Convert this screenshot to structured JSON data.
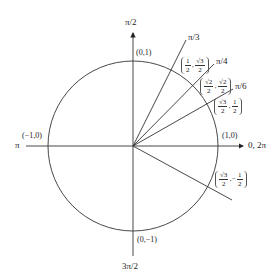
{
  "diagram": {
    "center": {
      "x": 133,
      "y": 146
    },
    "radius": 85,
    "colors": {
      "stroke": "#333333",
      "text": "#222222"
    },
    "axes": {
      "positive_x_label": "0, 2π",
      "negative_x_label": "π",
      "positive_y_label": "π/2",
      "negative_y_label": "3π/2"
    },
    "axis_points": {
      "right": "(1,0)",
      "left": "(−1,0)",
      "top": "(0,1)",
      "bottom": "(0,−1)"
    },
    "rays": [
      {
        "angle_label": "π/3",
        "point": {
          "x_num": "1",
          "x_den": "2",
          "y_num": "√3",
          "y_den": "2"
        }
      },
      {
        "angle_label": "π/4",
        "point": {
          "x_num": "√2",
          "x_den": "2",
          "y_num": "√2",
          "y_den": "2"
        }
      },
      {
        "angle_label": "π/6",
        "point": {
          "x_num": "√3",
          "x_den": "2",
          "y_num": "1",
          "y_den": "2"
        }
      },
      {
        "angle_label": "",
        "point": {
          "x_num": "√3",
          "x_den": "2",
          "y_sign": "−",
          "y_num": "1",
          "y_den": "2"
        }
      }
    ]
  }
}
